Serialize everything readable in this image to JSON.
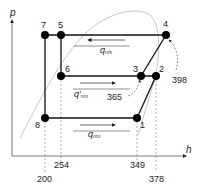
{
  "diagram": {
    "type": "p-h refrigeration cycle",
    "axes": {
      "y_label": "p",
      "x_label": "h"
    },
    "points": [
      {
        "id": "7",
        "label": "7"
      },
      {
        "id": "5",
        "label": "5"
      },
      {
        "id": "4",
        "label": "4"
      },
      {
        "id": "6",
        "label": "6"
      },
      {
        "id": "3",
        "label": "3"
      },
      {
        "id": "2",
        "label": "2"
      },
      {
        "id": "8",
        "label": "8"
      },
      {
        "id": "1",
        "label": "1"
      }
    ],
    "heat_labels": {
      "q_nrk": {
        "main": "q",
        "sub": "nrk"
      },
      "q_nro_prime": {
        "main": "q′",
        "sub": "nro"
      },
      "q_nro": {
        "main": "q",
        "sub": "nro"
      }
    },
    "annotations": {
      "a398": "398",
      "a365": "365"
    },
    "h_ticks": [
      "200",
      "254",
      "349",
      "378"
    ]
  }
}
